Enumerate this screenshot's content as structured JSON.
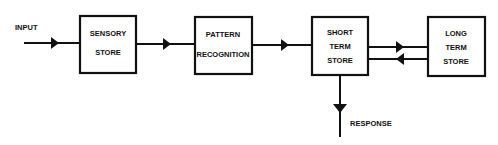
{
  "diagram": {
    "input_label": "INPUT",
    "response_label": "RESPONSE",
    "boxes": [
      {
        "id": "sensory",
        "lines": [
          "SENSORY",
          "STORE"
        ]
      },
      {
        "id": "pattern",
        "lines": [
          "PATTERN",
          "RECOGNITION"
        ]
      },
      {
        "id": "short",
        "lines": [
          "SHORT",
          "TERM",
          "STORE"
        ]
      },
      {
        "id": "long",
        "lines": [
          "LONG",
          "TERM",
          "STORE"
        ]
      }
    ],
    "connections": [
      {
        "from": "input",
        "to": "sensory"
      },
      {
        "from": "sensory",
        "to": "pattern"
      },
      {
        "from": "pattern",
        "to": "short"
      },
      {
        "from": "short",
        "to": "long"
      },
      {
        "from": "long",
        "to": "short"
      },
      {
        "from": "short",
        "to": "response"
      }
    ]
  },
  "colors": {
    "line": "#111111",
    "background": "#ffffff"
  }
}
